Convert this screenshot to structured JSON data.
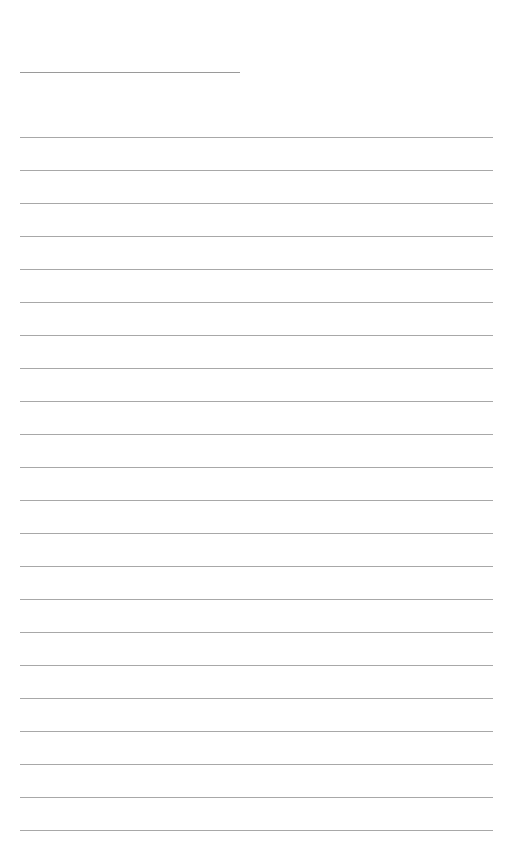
{
  "page": {
    "type": "ruled-page",
    "title_line": {
      "label": ""
    },
    "rule_count": 22,
    "rule_first_y": 137,
    "rule_spacing": 33,
    "line_color": "#a8a8a8"
  }
}
